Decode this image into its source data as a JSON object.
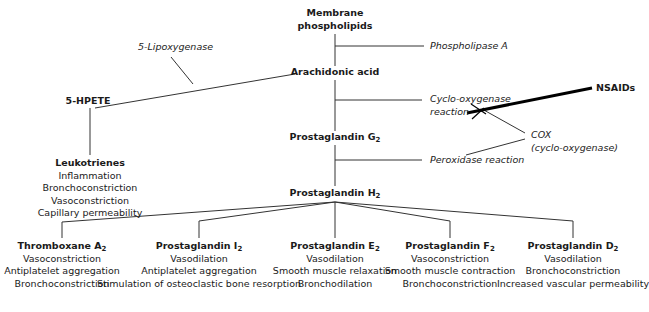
{
  "nodes": {
    "membrane": {
      "line1": "Membrane",
      "line2": "phospholipids"
    },
    "arachidonic": {
      "label": "Arachidonic acid"
    },
    "hpete": {
      "label": "5-HPETE"
    },
    "pgg2": {
      "label": "Prostaglandin G",
      "sub": "2"
    },
    "pgh2": {
      "label": "Prostaglandin H",
      "sub": "2"
    },
    "leukotrienes": {
      "title": "Leukotrienes",
      "effects": [
        "Inflammation",
        "Bronchoconstriction",
        "Vasoconstriction",
        "Capillary permeability"
      ]
    }
  },
  "enzymes": {
    "phospholipase": "Phospholipase A",
    "lipoxygenase": "5-Lipoxygenase",
    "cox_reaction_line1": "Cyclo-oxygenase",
    "cox_reaction_line2": "reaction",
    "peroxidase": "Peroxidase reaction",
    "cox_line1": "COX",
    "cox_line2": "(cyclo-oxygenase)"
  },
  "inhibitor": {
    "label": "NSAIDs"
  },
  "products": [
    {
      "title": "Thromboxane A",
      "sub": "2",
      "effects": [
        "Vasoconstriction",
        "Antiplatelet aggregation",
        "Bronchoconstriction"
      ]
    },
    {
      "title": "Prostaglandin I",
      "sub": "2",
      "effects": [
        "Vasodilation",
        "Antiplatelet aggregation",
        "Stimulation of osteoclastic bone resorption"
      ]
    },
    {
      "title": "Prostaglandin E",
      "sub": "2",
      "effects": [
        "Vasodilation",
        "Smooth muscle relaxation",
        "Bronchodilation"
      ]
    },
    {
      "title": "Prostaglandin F",
      "sub": "2",
      "effects": [
        "Vasoconstriction",
        "Smooth muscle contraction",
        "Bronchoconstriction"
      ]
    },
    {
      "title": "Prostaglandin D",
      "sub": "2",
      "effects": [
        "Vasodilation",
        "Bronchoconstriction",
        "Increased vascular permeability"
      ]
    }
  ],
  "colors": {
    "line": "#333333",
    "text": "#1a1a1a"
  }
}
